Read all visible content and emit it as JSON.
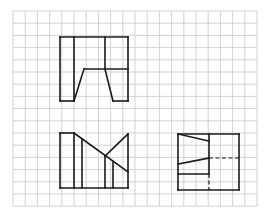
{
  "diagram": {
    "type": "orthographic-projection-drawing",
    "colors": {
      "background": "#ffffff",
      "grid": "#c8c8c8",
      "lines": "#1a1a1a"
    },
    "grid": {
      "x0": 13,
      "y0": 11,
      "step": 12.2,
      "cols": 20,
      "rows": 16
    },
    "views": [
      {
        "name": "front-view",
        "position": "top-left",
        "solid_lines": [
          [
            60,
            37,
            128,
            37
          ],
          [
            60,
            37,
            60,
            101
          ],
          [
            128,
            37,
            128,
            101
          ],
          [
            60,
            101,
            74,
            101
          ],
          [
            113,
            101,
            128,
            101
          ],
          [
            74,
            37,
            74,
            101
          ],
          [
            105,
            37,
            105,
            69
          ],
          [
            84,
            69,
            128,
            69
          ],
          [
            74,
            101,
            84,
            69
          ],
          [
            105,
            69,
            113,
            101
          ]
        ],
        "dashed_lines": []
      },
      {
        "name": "top-view",
        "position": "bottom-left",
        "solid_lines": [
          [
            60,
            133,
            74,
            133
          ],
          [
            60,
            133,
            60,
            188
          ],
          [
            60,
            188,
            128,
            188
          ],
          [
            128,
            134,
            128,
            188
          ],
          [
            74,
            133,
            74,
            188
          ],
          [
            82,
            139,
            82,
            188
          ],
          [
            74,
            133,
            128,
            172
          ],
          [
            105,
            156,
            128,
            134
          ],
          [
            105,
            156,
            105,
            188
          ],
          [
            113,
            161,
            113,
            188
          ]
        ],
        "dashed_lines": []
      },
      {
        "name": "side-view",
        "position": "bottom-right",
        "solid_lines": [
          [
            178,
            134,
            239,
            134
          ],
          [
            178,
            134,
            178,
            190
          ],
          [
            239,
            134,
            239,
            190
          ],
          [
            178,
            190,
            239,
            190
          ],
          [
            209,
            134,
            209,
            174
          ],
          [
            178,
            134,
            209,
            141
          ],
          [
            178,
            164,
            209,
            158
          ],
          [
            178,
            174,
            209,
            174
          ]
        ],
        "dashed_lines": [
          [
            209,
            158,
            239,
            158
          ],
          [
            209,
            174,
            209,
            190
          ]
        ]
      }
    ]
  }
}
